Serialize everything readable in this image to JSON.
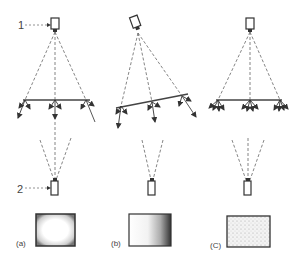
{
  "figure": {
    "callouts": [
      {
        "id": "1",
        "label": "1",
        "target": "light-source"
      },
      {
        "id": "2",
        "label": "2",
        "target": "camera"
      }
    ],
    "panels": [
      {
        "id": "a",
        "label": "(a)",
        "description": "source above, reflector horizontal, camera below; image darkened at edges"
      },
      {
        "id": "b",
        "label": "(b)",
        "description": "source tilted, reflector tilted; image dark on right side"
      },
      {
        "id": "c",
        "label": "(C)",
        "description": "source above, diffuse reflector with spread rays; image uniformly textured"
      }
    ]
  },
  "colors": {
    "line": "#444444",
    "dash": "#666666",
    "background": "#ffffff"
  }
}
